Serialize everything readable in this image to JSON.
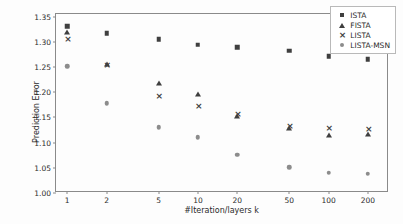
{
  "chart_data": {
    "type": "scatter",
    "title": "",
    "xlabel": "#Iteration/layers k",
    "ylabel": "Prediction Error",
    "xscale": "log",
    "x": [
      1,
      2,
      5,
      10,
      20,
      50,
      100,
      200
    ],
    "xtick_labels": [
      "1",
      "2",
      "5",
      "10",
      "20",
      "50",
      "100",
      "200"
    ],
    "ytick_labels": [
      "1.00",
      "1.05",
      "1.10",
      "1.15",
      "1.20",
      "1.25",
      "1.30",
      "1.35"
    ],
    "ylim": [
      1.0,
      1.355
    ],
    "grid": false,
    "legend_position": "upper right",
    "series": [
      {
        "name": "ISTA",
        "marker": "square",
        "color": "#3f3f3f",
        "values": [
          1.331,
          1.317,
          1.305,
          1.294,
          1.289,
          1.282,
          1.271,
          1.265
        ]
      },
      {
        "name": "FISTA",
        "marker": "triangle",
        "color": "#3f3f3f",
        "values": [
          1.32,
          1.256,
          1.219,
          1.196,
          1.153,
          1.129,
          1.116,
          1.117
        ]
      },
      {
        "name": "LISTA",
        "marker": "x",
        "color": "#3f3f3f",
        "values": [
          1.306,
          1.254,
          1.192,
          1.173,
          1.157,
          1.133,
          1.129,
          1.126
        ]
      },
      {
        "name": "LISTA-MSN",
        "marker": "circle",
        "color": "#8c8c8c",
        "values": [
          1.251,
          1.178,
          1.13,
          1.111,
          1.076,
          1.051,
          1.04,
          1.038
        ]
      }
    ]
  },
  "legend": {
    "items": [
      {
        "label": "ISTA"
      },
      {
        "label": "FISTA"
      },
      {
        "label": "LISTA"
      },
      {
        "label": "LISTA-MSN"
      }
    ]
  }
}
